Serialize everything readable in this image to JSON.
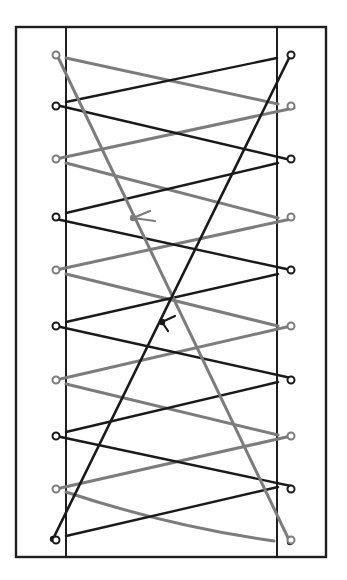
{
  "diagram": {
    "title": "Shoe lacing diagram — double-helix criss-cross with two diagonal crossing laces",
    "canvas": {
      "width": 347,
      "height": 580,
      "background": "#ffffff"
    },
    "colors": {
      "border": "#1e1e1e",
      "lace_dark": "#1a1a1a",
      "lace_gray": "#7c7c7c"
    },
    "frame": {
      "outer": {
        "x1": 16,
        "y1": 27,
        "x2": 326,
        "y2": 557
      },
      "inner_left_x": 66,
      "inner_right_x": 277
    },
    "eyelets": {
      "left_x": 56,
      "right_x": 291,
      "radius": 3.5,
      "levels_y": [
        55,
        106,
        159,
        217,
        270,
        326,
        380,
        436,
        489,
        540
      ],
      "left_colors": [
        "gray",
        "dark",
        "gray",
        "dark",
        "gray",
        "dark",
        "gray",
        "dark",
        "gray",
        "dark"
      ],
      "right_colors": [
        "dark",
        "gray",
        "dark",
        "gray",
        "dark",
        "gray",
        "dark",
        "gray",
        "dark",
        "gray"
      ]
    },
    "laces": {
      "diagonals": [
        {
          "name": "gray-diagonal-lace",
          "color": "gray",
          "from": [
            57,
            55
          ],
          "to": [
            290,
            542
          ]
        },
        {
          "name": "dark-diagonal-lace",
          "color": "dark",
          "from": [
            291,
            54
          ],
          "to": [
            53,
            539
          ]
        }
      ],
      "crossings": [
        {
          "band": 0,
          "type": "inner",
          "gray": [
            [
              66,
              58
            ],
            [
              278,
              104
            ]
          ],
          "dark": [
            [
              66,
              102
            ],
            [
              277,
              58
            ]
          ]
        },
        {
          "band": 1,
          "type": "eyelet",
          "gray": [
            [
              56,
              159
            ],
            [
              294,
              108
            ]
          ],
          "dark": [
            [
              56,
              105
            ],
            [
              291,
              160
            ]
          ]
        },
        {
          "band": 2,
          "type": "inner",
          "gray": [
            [
              66,
              163
            ],
            [
              278,
              218
            ]
          ],
          "dark": [
            [
              66,
              213
            ],
            [
              278,
              163
            ]
          ]
        },
        {
          "band": 3,
          "type": "eyelet",
          "gray": [
            [
              56,
              270
            ],
            [
              291,
              219
            ]
          ],
          "dark": [
            [
              56,
              219
            ],
            [
              291,
              270
            ]
          ]
        },
        {
          "band": 4,
          "type": "inner",
          "gray": [
            [
              66,
              274
            ],
            [
              278,
              326
            ]
          ],
          "dark": [
            [
              66,
              322
            ],
            [
              278,
              274
            ]
          ]
        },
        {
          "band": 5,
          "type": "eyelet",
          "gray": [
            [
              56,
              380
            ],
            [
              291,
              326
            ]
          ],
          "dark": [
            [
              56,
              326
            ],
            [
              291,
              378
            ]
          ]
        },
        {
          "band": 6,
          "type": "inner",
          "gray": [
            [
              66,
              384
            ],
            [
              278,
              435
            ]
          ],
          "dark": [
            [
              66,
              432
            ],
            [
              278,
              382
            ]
          ]
        },
        {
          "band": 7,
          "type": "eyelet",
          "gray": [
            [
              56,
              489
            ],
            [
              291,
              436
            ]
          ],
          "dark": [
            [
              56,
              436
            ],
            [
              291,
              486
            ]
          ]
        },
        {
          "band": 8,
          "type": "inner",
          "gray": [
            [
              66,
              492
            ],
            [
              274,
              541
            ]
          ],
          "dark": [
            [
              66,
              536
            ],
            [
              278,
              487
            ]
          ]
        }
      ]
    },
    "direction_arrows": [
      {
        "name": "gray-direction-arrow",
        "color": "gray",
        "at": [
          133,
          218
        ],
        "strokes": [
          [
            [
              133,
              218
            ],
            [
              150,
              211
            ]
          ],
          [
            [
              133,
              218
            ],
            [
              155,
              221
            ]
          ]
        ]
      },
      {
        "name": "dark-direction-arrow",
        "color": "dark",
        "at": [
          162,
          322
        ],
        "strokes": [
          [
            [
              162,
              322
            ],
            [
              175,
              316
            ]
          ],
          [
            [
              162,
              322
            ],
            [
              168,
              331
            ]
          ]
        ]
      }
    ]
  }
}
